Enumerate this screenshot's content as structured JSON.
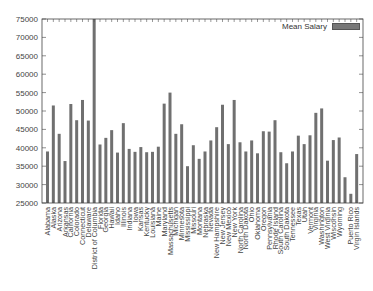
{
  "chart_data": {
    "type": "bar",
    "title": "",
    "xlabel": "",
    "ylabel": "",
    "ylim": [
      25000,
      75000
    ],
    "yticks": [
      25000,
      30000,
      35000,
      40000,
      45000,
      50000,
      55000,
      60000,
      65000,
      70000,
      75000
    ],
    "legend": {
      "position": "top-right",
      "entries": [
        "Mean Salary"
      ]
    },
    "grid": false,
    "categories": [
      "Alabama",
      "Alaska",
      "Arizona",
      "Arkansas",
      "California",
      "Colorado",
      "Connecticut",
      "Delaware",
      "District of Columbia",
      "Florida",
      "Georgia",
      "Hawaii",
      "Idaho",
      "Illinois",
      "Indiana",
      "Iowa",
      "Kansas",
      "Kentucky",
      "Louisiana",
      "Maine",
      "Maryland",
      "Massachusetts",
      "Michigan",
      "Minnesota",
      "Mississippi",
      "Missouri",
      "Montana",
      "Nebraska",
      "Nevada",
      "New Hampshire",
      "New Jersey",
      "New Mexico",
      "New York",
      "North Carolina",
      "North Dakota",
      "Ohio",
      "Oklahoma",
      "Oregon",
      "Pennsylvania",
      "Rhode Island",
      "South Carolina",
      "South Dakota",
      "Tennessee",
      "Texas",
      "Utah",
      "Vermont",
      "Virginia",
      "Washington",
      "West Virginia",
      "Wisconsin",
      "Wyoming",
      "",
      "Puerto Rico",
      "Virgin Islands"
    ],
    "series": [
      {
        "name": "Mean Salary",
        "color": "#707070",
        "values": [
          39000,
          51500,
          43800,
          36400,
          51900,
          47500,
          53000,
          47400,
          75000,
          40900,
          42700,
          44800,
          38700,
          46700,
          39700,
          38900,
          40200,
          38800,
          38900,
          40300,
          52000,
          55000,
          43800,
          46400,
          35000,
          40700,
          37000,
          39000,
          42000,
          45600,
          51700,
          41000,
          53000,
          41500,
          39000,
          42000,
          38500,
          44500,
          44400,
          47500,
          38800,
          35800,
          39000,
          43300,
          41000,
          43400,
          49500,
          50700,
          36500,
          42100,
          42800,
          32000,
          27500,
          38300
        ]
      }
    ]
  }
}
